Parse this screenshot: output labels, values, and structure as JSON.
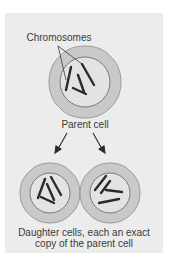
{
  "diagram": {
    "labels": {
      "chromosomes": "Chromosomes",
      "parent": "Parent cell",
      "daughters_line1": "Daughter cells, each an exact",
      "daughters_line2": "copy of the parent cell"
    },
    "colors": {
      "background": "#ececec",
      "cytoplasm": "#c9c9c9",
      "cell_outline": "#8c8c8c",
      "nucleus": "#e3e3e3",
      "chromosome": "#2a2a2a",
      "text": "#3a3a3a"
    }
  }
}
